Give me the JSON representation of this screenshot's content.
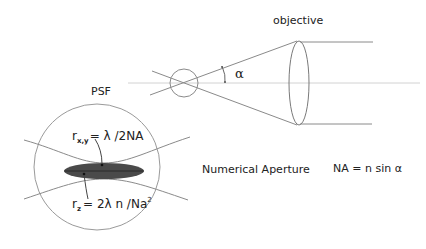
{
  "diagram": {
    "labels": {
      "objective": "objective",
      "psf": "PSF",
      "alpha": "α",
      "numerical_aperture": "Numerical Aperture",
      "na_formula": "NA = n sin α",
      "rxy_r": "r",
      "rxy_sub": "x,y",
      "rxy_rhs": "= λ /2NA",
      "rz_r": "r",
      "rz_sub": "z",
      "rz_rhs": "= 2λ n /Na",
      "rz_sup": "2"
    },
    "colors": {
      "line": "#8a8a8a",
      "axis": "#cfcfcf",
      "psf_fill": "#4a4a4a",
      "text": "#222222"
    }
  }
}
